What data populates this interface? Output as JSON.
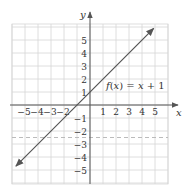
{
  "chart_data": {
    "type": "line",
    "title": "",
    "xlabel": "x",
    "ylabel": "y",
    "xlim": [
      -6,
      6
    ],
    "ylim": [
      -6,
      6
    ],
    "grid": true,
    "x_ticks": [
      -5,
      -4,
      -3,
      -2,
      1,
      2,
      3,
      4,
      5
    ],
    "y_ticks": [
      5,
      4,
      3,
      2,
      1,
      -1,
      -2,
      -3,
      -4,
      -5
    ],
    "x_tick_labels": [
      "−5",
      "−4",
      "−3",
      "−2",
      "1",
      "2",
      "3",
      "4",
      "5"
    ],
    "y_tick_labels": [
      "5",
      "4",
      "3",
      "2",
      "1",
      "−1",
      "−2",
      "−3",
      "−4",
      "−5"
    ],
    "series": [
      {
        "name": "f(x) = x + 1",
        "equation": "f(x) = x + 1",
        "x": [
          -5.7,
          4.9
        ],
        "y": [
          -4.7,
          5.9
        ],
        "arrows": "both",
        "color": "#555555"
      }
    ],
    "reference_lines": [
      {
        "type": "horizontal",
        "y": -2.5,
        "style": "dashed",
        "color": "#bbbbbb"
      }
    ],
    "annotations": [
      {
        "text": "f(x) = x + 1",
        "x": 1.2,
        "y": 1.5
      }
    ]
  },
  "labels": {
    "x_axis": "x",
    "y_axis": "y",
    "function": "f(x) = x + 1",
    "xticks": [
      "−5",
      "−4",
      "−3",
      "−2",
      "1",
      "2",
      "3",
      "4",
      "5"
    ],
    "yticks": [
      "5",
      "4",
      "3",
      "2",
      "1",
      "−1",
      "−2",
      "−3",
      "−4",
      "−5"
    ]
  },
  "colors": {
    "grid": "#d6d6d6",
    "axis": "#555555",
    "line": "#555555",
    "dashed": "#bbbbbb"
  }
}
